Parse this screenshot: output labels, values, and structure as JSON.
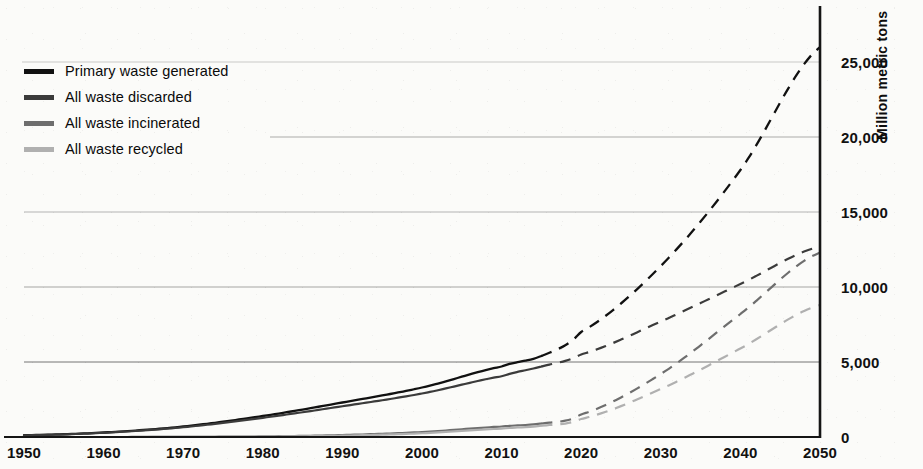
{
  "chart_data": {
    "type": "line",
    "title": "",
    "xlabel": "",
    "ylabel": "Million metric tons",
    "xlim": [
      1950,
      2050
    ],
    "ylim": [
      0,
      27000
    ],
    "grid": true,
    "legend_position": "top-left",
    "x_ticks": [
      "1950",
      "1960",
      "1970",
      "1980",
      "1990",
      "2000",
      "2010",
      "2020",
      "2030",
      "2040",
      "2050"
    ],
    "x_tick_values": [
      1950,
      1960,
      1970,
      1980,
      1990,
      2000,
      2010,
      2020,
      2030,
      2040,
      2050
    ],
    "y_ticks": [
      "0",
      "5,000",
      "10,000",
      "15,000",
      "20,000",
      "25,000"
    ],
    "y_tick_values": [
      0,
      5000,
      10000,
      15000,
      20000,
      25000
    ],
    "historical_end_year": 2015,
    "x": [
      1950,
      1960,
      1970,
      1980,
      1990,
      2000,
      2010,
      2015,
      2020,
      2030,
      2040,
      2050
    ],
    "series": [
      {
        "name": "Primary waste generated",
        "color": "#111111",
        "values": [
          120,
          300,
          700,
          1400,
          2300,
          3300,
          4700,
          5400,
          7000,
          11400,
          17800,
          26000
        ]
      },
      {
        "name": "All waste discarded",
        "color": "#3b3b3b",
        "values": [
          110,
          280,
          650,
          1280,
          2050,
          2900,
          4050,
          4700,
          5500,
          7700,
          10200,
          12700
        ]
      },
      {
        "name": "All waste incinerated",
        "color": "#6e6e6e",
        "values": [
          0,
          0,
          10,
          40,
          130,
          330,
          700,
          900,
          1500,
          4200,
          8200,
          12300
        ]
      },
      {
        "name": "All waste recycled",
        "color": "#b0b0b0",
        "values": [
          0,
          0,
          5,
          25,
          90,
          250,
          560,
          750,
          1200,
          3200,
          5900,
          8800
        ]
      }
    ]
  },
  "legend": {
    "items": [
      {
        "label": "Primary waste generated",
        "color": "#111111"
      },
      {
        "label": "All waste discarded",
        "color": "#3b3b3b"
      },
      {
        "label": "All waste incinerated",
        "color": "#6e6e6e"
      },
      {
        "label": "All waste recycled",
        "color": "#b0b0b0"
      }
    ]
  },
  "axis": {
    "y_title": "Million metric tons"
  }
}
